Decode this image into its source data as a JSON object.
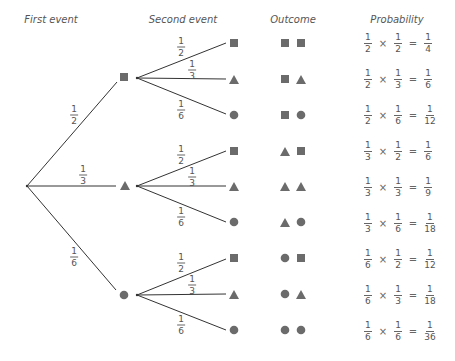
{
  "headers": {
    "first_event": "First event",
    "second_event": "Second event",
    "outcome": "Outcome",
    "probability": "Probability"
  },
  "colors": {
    "shape_fill": "#6b6b6b",
    "line": "#333333",
    "text": "#555555"
  },
  "first_event": {
    "branches": [
      {
        "shape": "square",
        "label": {
          "num": "1",
          "den": "2"
        }
      },
      {
        "shape": "triangle",
        "label": {
          "num": "1",
          "den": "3"
        }
      },
      {
        "shape": "circle",
        "label": {
          "num": "1",
          "den": "6"
        }
      }
    ]
  },
  "second_event": {
    "branches": [
      {
        "shape": "square",
        "label": {
          "num": "1",
          "den": "2"
        }
      },
      {
        "shape": "triangle",
        "label": {
          "num": "1",
          "den": "3"
        }
      },
      {
        "shape": "circle",
        "label": {
          "num": "1",
          "den": "6"
        }
      }
    ]
  },
  "rows": [
    {
      "outcome": [
        "square",
        "square"
      ],
      "p1": {
        "num": "1",
        "den": "2"
      },
      "p2": {
        "num": "1",
        "den": "2"
      },
      "result": {
        "num": "1",
        "den": "4"
      }
    },
    {
      "outcome": [
        "square",
        "triangle"
      ],
      "p1": {
        "num": "1",
        "den": "2"
      },
      "p2": {
        "num": "1",
        "den": "3"
      },
      "result": {
        "num": "1",
        "den": "6"
      }
    },
    {
      "outcome": [
        "square",
        "circle"
      ],
      "p1": {
        "num": "1",
        "den": "2"
      },
      "p2": {
        "num": "1",
        "den": "6"
      },
      "result": {
        "num": "1",
        "den": "12"
      }
    },
    {
      "outcome": [
        "triangle",
        "square"
      ],
      "p1": {
        "num": "1",
        "den": "3"
      },
      "p2": {
        "num": "1",
        "den": "2"
      },
      "result": {
        "num": "1",
        "den": "6"
      }
    },
    {
      "outcome": [
        "triangle",
        "triangle"
      ],
      "p1": {
        "num": "1",
        "den": "3"
      },
      "p2": {
        "num": "1",
        "den": "3"
      },
      "result": {
        "num": "1",
        "den": "9"
      }
    },
    {
      "outcome": [
        "triangle",
        "circle"
      ],
      "p1": {
        "num": "1",
        "den": "3"
      },
      "p2": {
        "num": "1",
        "den": "6"
      },
      "result": {
        "num": "1",
        "den": "18"
      }
    },
    {
      "outcome": [
        "circle",
        "square"
      ],
      "p1": {
        "num": "1",
        "den": "6"
      },
      "p2": {
        "num": "1",
        "den": "2"
      },
      "result": {
        "num": "1",
        "den": "12"
      }
    },
    {
      "outcome": [
        "circle",
        "triangle"
      ],
      "p1": {
        "num": "1",
        "den": "6"
      },
      "p2": {
        "num": "1",
        "den": "3"
      },
      "result": {
        "num": "1",
        "den": "18"
      }
    },
    {
      "outcome": [
        "circle",
        "circle"
      ],
      "p1": {
        "num": "1",
        "den": "6"
      },
      "p2": {
        "num": "1",
        "den": "6"
      },
      "result": {
        "num": "1",
        "den": "36"
      }
    }
  ],
  "symbols": {
    "times": "×",
    "equals": "="
  }
}
